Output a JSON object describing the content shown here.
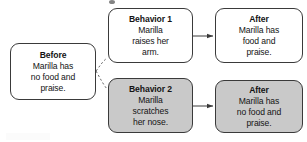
{
  "diagram": {
    "type": "flowchart",
    "nodes": [
      {
        "id": "before",
        "title": "Before",
        "body": "Marilla has\nno food and\npraise.",
        "shaded": false
      },
      {
        "id": "behavior1",
        "title": "Behavior 1",
        "body": "Marilla\nraises her\narm.",
        "shaded": false
      },
      {
        "id": "after1",
        "title": "After",
        "body": "Marilla has\nfood and\npraise.",
        "shaded": false
      },
      {
        "id": "behavior2",
        "title": "Behavior 2",
        "body": "Marilla\nscratches\nher nose.",
        "shaded": true
      },
      {
        "id": "after2",
        "title": "After",
        "body": "Marilla has\nno food and\npraise.",
        "shaded": true
      }
    ],
    "connectors": [
      {
        "id": "before-to-behavior1",
        "from": "before",
        "to": "behavior1",
        "style": "dashed",
        "arrowhead": false
      },
      {
        "id": "before-to-behavior2",
        "from": "before",
        "to": "behavior2",
        "style": "dashed",
        "arrowhead": false
      },
      {
        "id": "behavior1-to-after1",
        "from": "behavior1",
        "to": "after1",
        "style": "solid",
        "arrowhead": true
      },
      {
        "id": "behavior2-to-after2",
        "from": "behavior2",
        "to": "after2",
        "style": "solid",
        "arrowhead": true
      }
    ],
    "colors": {
      "box_border": "#3a3a3a",
      "box_fill": "#ffffff",
      "box_fill_shaded": "#c9c9c9",
      "text": "#141414",
      "connector": "#555555",
      "background": "#ffffff"
    }
  }
}
